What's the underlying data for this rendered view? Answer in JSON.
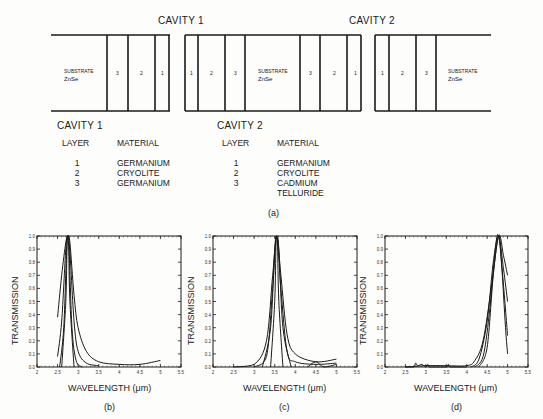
{
  "diagram": {
    "cavity_titles": [
      "CAVITY 1",
      "CAVITY 2"
    ],
    "blocks": [
      {
        "substrate_label": "SUBSTRATE",
        "substrate_material": "ZnSe",
        "layers": [
          "3",
          "2",
          "1"
        ]
      },
      {
        "layers_left": [
          "1",
          "2",
          "3"
        ],
        "substrate_label": "SUBSTRATE",
        "substrate_material": "ZnSe",
        "layers_right": [
          "3",
          "2",
          "1"
        ]
      },
      {
        "layers": [
          "1",
          "2",
          "3"
        ],
        "substrate_label": "SUBSTRATE",
        "substrate_material": "ZnSe"
      }
    ]
  },
  "tables": [
    {
      "title": "CAVITY 1",
      "headers": [
        "LAYER",
        "MATERIAL"
      ],
      "rows": [
        {
          "layer": "1",
          "material": "GERMANIUM"
        },
        {
          "layer": "2",
          "material": "CRYOLITE"
        },
        {
          "layer": "3",
          "material": "GERMANIUM"
        }
      ]
    },
    {
      "title": "CAVITY 2",
      "headers": [
        "LAYER",
        "MATERIAL"
      ],
      "rows": [
        {
          "layer": "1",
          "material": "GERMANIUM"
        },
        {
          "layer": "2",
          "material": "CRYOLITE"
        },
        {
          "layer": "3",
          "material": "CADMIUM"
        },
        {
          "layer": "",
          "material": "TELLURIDE"
        }
      ]
    }
  ],
  "captions": {
    "a": "(a)",
    "b": "(b)",
    "c": "(c)",
    "d": "(d)"
  },
  "chart_data": [
    {
      "type": "line",
      "title": "(b)",
      "xlabel": "WAVELENGTH (μm)",
      "ylabel": "TRANSMISSION",
      "xlim": [
        2,
        5.5
      ],
      "ylim": [
        0,
        1.0
      ],
      "x_ticks": [
        "2",
        "2.5",
        "3",
        "3.5",
        "4",
        "4.5",
        "5",
        "5.5"
      ],
      "y_ticks": [
        "0.0",
        "0.1",
        "0.2",
        "0.3",
        "0.4",
        "0.5",
        "0.6",
        "0.7",
        "0.8",
        "0.9",
        "1.0"
      ],
      "peak_wavelength": 2.75,
      "series": [
        {
          "name": "curve-1",
          "x": [
            2.5,
            2.6,
            2.7,
            2.75,
            2.8,
            2.9,
            3.0,
            3.2,
            3.5,
            4.0,
            4.5,
            5.0
          ],
          "y": [
            0.38,
            0.7,
            0.95,
            1.0,
            0.95,
            0.55,
            0.3,
            0.12,
            0.04,
            0.02,
            0.02,
            0.05
          ]
        },
        {
          "name": "curve-2",
          "x": [
            2.5,
            2.6,
            2.7,
            2.75,
            2.8,
            2.9,
            3.0,
            3.2,
            3.5
          ],
          "y": [
            0.08,
            0.35,
            0.9,
            1.0,
            0.88,
            0.35,
            0.12,
            0.03,
            0.01
          ]
        },
        {
          "name": "curve-3",
          "x": [
            2.55,
            2.65,
            2.72,
            2.75,
            2.78,
            2.85,
            2.95,
            3.1
          ],
          "y": [
            0.0,
            0.3,
            0.9,
            1.0,
            0.9,
            0.3,
            0.05,
            0.0
          ]
        },
        {
          "name": "curve-4",
          "x": [
            2.6,
            2.7,
            2.73,
            2.75,
            2.77,
            2.8,
            2.9
          ],
          "y": [
            0.0,
            0.5,
            0.92,
            1.0,
            0.92,
            0.5,
            0.0
          ]
        }
      ]
    },
    {
      "type": "line",
      "title": "(c)",
      "xlabel": "WAVELENGTH (μm)",
      "ylabel": "TRANSMISSION",
      "xlim": [
        2,
        5.5
      ],
      "ylim": [
        0,
        1.0
      ],
      "x_ticks": [
        "2",
        "2.5",
        "3",
        "3.5",
        "4",
        "4.5",
        "5",
        "5.5"
      ],
      "y_ticks": [
        "0.0",
        "0.1",
        "0.2",
        "0.3",
        "0.4",
        "0.5",
        "0.6",
        "0.7",
        "0.8",
        "0.9",
        "1.0"
      ],
      "peak_wavelength": 3.55,
      "series": [
        {
          "name": "curve-1",
          "x": [
            2.5,
            3.0,
            3.3,
            3.45,
            3.55,
            3.65,
            3.8,
            4.0,
            4.5,
            5.0
          ],
          "y": [
            0.0,
            0.02,
            0.2,
            0.7,
            1.0,
            0.7,
            0.25,
            0.1,
            0.04,
            0.06
          ]
        },
        {
          "name": "curve-2",
          "x": [
            3.0,
            3.3,
            3.45,
            3.55,
            3.65,
            3.8,
            4.0,
            4.5,
            5.0
          ],
          "y": [
            0.0,
            0.08,
            0.6,
            1.0,
            0.6,
            0.12,
            0.04,
            0.02,
            0.03
          ]
        },
        {
          "name": "curve-3",
          "x": [
            3.2,
            3.4,
            3.5,
            3.55,
            3.6,
            3.7,
            3.9
          ],
          "y": [
            0.0,
            0.3,
            0.9,
            1.0,
            0.9,
            0.3,
            0.0
          ]
        },
        {
          "name": "curve-4",
          "x": [
            3.4,
            3.5,
            3.53,
            3.55,
            3.57,
            3.6,
            3.7
          ],
          "y": [
            0.0,
            0.5,
            0.92,
            1.0,
            0.92,
            0.5,
            0.0
          ]
        },
        {
          "name": "curve-5",
          "x": [
            4.3,
            4.5,
            4.7,
            5.0
          ],
          "y": [
            0.0,
            0.04,
            0.0,
            0.02
          ]
        }
      ]
    },
    {
      "type": "line",
      "title": "(d)",
      "xlabel": "WAVELENGTH (μm)",
      "ylabel": "TRANSMISSION",
      "xlim": [
        2,
        5.5
      ],
      "ylim": [
        0,
        1.0
      ],
      "x_ticks": [
        "2",
        "2.5",
        "3",
        "3.5",
        "4",
        "4.5",
        "5",
        "5.5"
      ],
      "y_ticks": [
        "0.0",
        "0.1",
        "0.2",
        "0.3",
        "0.4",
        "0.5",
        "0.6",
        "0.7",
        "0.8",
        "0.9",
        "1.0"
      ],
      "peak_wavelength": 4.78,
      "series": [
        {
          "name": "curve-1",
          "x": [
            2.5,
            3.0,
            3.5,
            4.0,
            4.2,
            4.4,
            4.6,
            4.78,
            4.9,
            5.0
          ],
          "y": [
            0.0,
            0.01,
            0.01,
            0.01,
            0.05,
            0.2,
            0.6,
            1.0,
            0.85,
            0.7
          ]
        },
        {
          "name": "curve-2",
          "x": [
            4.1,
            4.3,
            4.5,
            4.65,
            4.78,
            4.9,
            5.0
          ],
          "y": [
            0.0,
            0.06,
            0.35,
            0.8,
            1.0,
            0.75,
            0.5
          ]
        },
        {
          "name": "curve-3",
          "x": [
            4.2,
            4.4,
            4.55,
            4.7,
            4.78,
            4.88,
            5.0
          ],
          "y": [
            0.0,
            0.08,
            0.4,
            0.9,
            1.0,
            0.7,
            0.24
          ]
        },
        {
          "name": "curve-4",
          "x": [
            4.3,
            4.5,
            4.65,
            4.78,
            4.85,
            4.95,
            5.0
          ],
          "y": [
            0.0,
            0.15,
            0.7,
            1.0,
            0.8,
            0.3,
            0.1
          ]
        },
        {
          "name": "noise",
          "x": [
            2.5,
            2.7,
            2.75,
            2.8,
            2.9,
            3.0,
            3.05,
            3.1,
            3.5,
            3.55,
            3.6,
            4.0
          ],
          "y": [
            0.0,
            0.0,
            0.03,
            0.01,
            0.02,
            0.0,
            0.02,
            0.0,
            0.0,
            0.02,
            0.0,
            0.0
          ]
        }
      ]
    }
  ]
}
